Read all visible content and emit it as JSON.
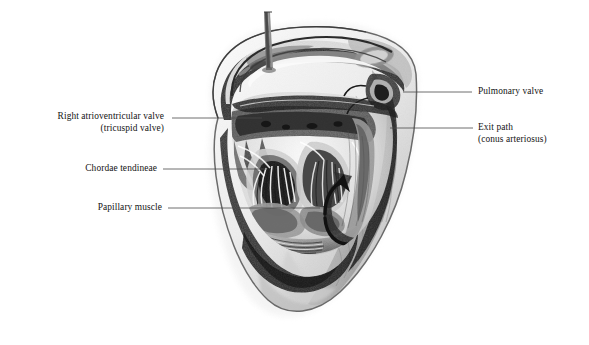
{
  "figure": {
    "style": "pencil shaded anatomical drawing",
    "background_color": "#ffffff",
    "ink_color": "#141414",
    "leader_color": "#4a4a4a"
  },
  "labels": {
    "tricuspid": {
      "line1": "Right atrioventricular valve",
      "line2": "(tricuspid valve)",
      "side": "left"
    },
    "chordae": {
      "line1": "Chordae tendineae",
      "line2": "",
      "side": "left"
    },
    "papillary": {
      "line1": "Papillary muscle",
      "line2": "",
      "side": "left"
    },
    "pulmonary": {
      "line1": "Pulmonary valve",
      "line2": "",
      "side": "right"
    },
    "exit_path": {
      "line1": "Exit path",
      "line2": "(conus arteriosus)",
      "side": "right"
    }
  },
  "structures": {
    "probe": "probe-rod",
    "flow_arrow": "blood-flow-arrow",
    "myocardium": "ventricle-wall",
    "apex": "ventricle-apex"
  }
}
